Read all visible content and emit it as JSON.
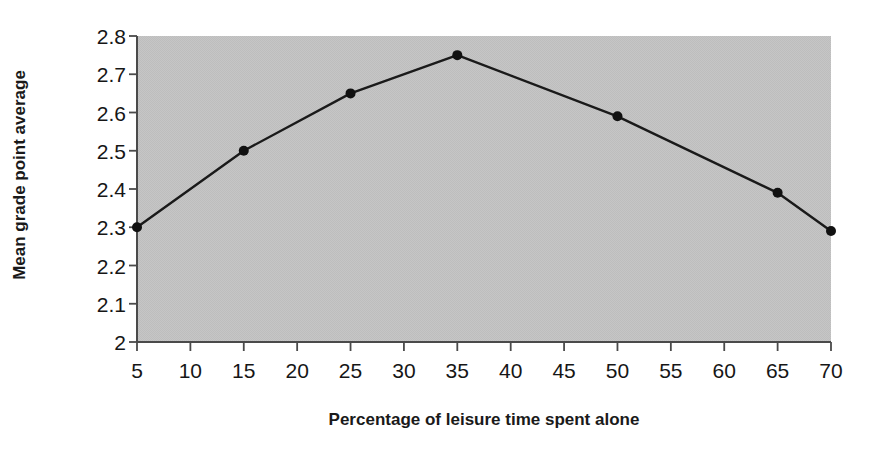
{
  "chart_data": {
    "type": "line",
    "title": "",
    "xlabel": "Percentage of leisure time spent alone",
    "ylabel": "Mean grade point average",
    "x": [
      5,
      15,
      25,
      35,
      50,
      65,
      70
    ],
    "values": [
      2.3,
      2.5,
      2.65,
      2.75,
      2.59,
      2.39,
      2.29
    ],
    "series": [
      {
        "name": "Mean grade point average",
        "x": [
          5,
          15,
          25,
          35,
          50,
          65,
          70
        ],
        "values": [
          2.3,
          2.5,
          2.65,
          2.75,
          2.59,
          2.39,
          2.29
        ]
      }
    ],
    "xlim": [
      5,
      70
    ],
    "ylim": [
      2.0,
      2.8
    ],
    "xticks": [
      5,
      10,
      15,
      20,
      25,
      30,
      35,
      40,
      45,
      50,
      55,
      60,
      65,
      70
    ],
    "xtick_labels": [
      "5",
      "10",
      "15",
      "20",
      "25",
      "30",
      "35",
      "40",
      "45",
      "50",
      "55",
      "60",
      "65",
      "70"
    ],
    "yticks": [
      2.0,
      2.1,
      2.2,
      2.3,
      2.4,
      2.5,
      2.6,
      2.7,
      2.8
    ],
    "ytick_labels": [
      "2",
      "2.1",
      "2.2",
      "2.3",
      "2.4",
      "2.5",
      "2.6",
      "2.7",
      "2.8"
    ],
    "grid": false,
    "legend": false,
    "legend_position": "none",
    "marker": "filled-circle",
    "colors": {
      "line": "#1a1a1a",
      "marker": "#111111",
      "plot_background": "#c3c3c3",
      "figure_background": "#ffffff",
      "axis": "#4a4a4a",
      "text": "#161616"
    }
  }
}
